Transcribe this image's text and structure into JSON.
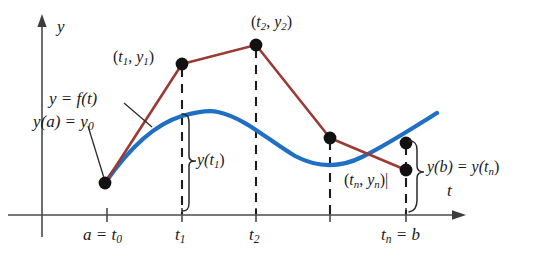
{
  "figure": {
    "colors": {
      "exact_curve": "#1f6fc4",
      "polygonal_path": "#9c3a35",
      "axis": "#4a4a4a",
      "point": "#121212",
      "text": "#1a1a1a",
      "background": "#ffffff"
    },
    "axes": {
      "y_axis_label": "y",
      "t_axis_label": "t"
    },
    "curve_label": "y = f(t)",
    "initial_value_label_parts": {
      "main": "y(a) = y",
      "sub": "0"
    },
    "points": [
      {
        "name": "t0-point",
        "px": 105,
        "py": 183,
        "label": null
      },
      {
        "name": "t1-point",
        "px": 182,
        "py": 64,
        "label": "(t1, y1)"
      },
      {
        "name": "t2-point",
        "px": 256,
        "py": 45,
        "label": "(t2, y2)"
      },
      {
        "name": "t3-point",
        "px": 330,
        "py": 138,
        "label": null
      },
      {
        "name": "tn-blue-point",
        "px": 406,
        "py": 143,
        "label": null
      },
      {
        "name": "tn-point",
        "px": 406,
        "py": 170,
        "label": "(tn, yn)"
      }
    ],
    "point_labels": [
      {
        "name": "label-t1y1",
        "open": "(",
        "t": "t",
        "tsub": "1",
        "comma": ", ",
        "y": "y",
        "ysub": "1",
        "close": ")"
      },
      {
        "name": "label-t2y2",
        "open": "(",
        "t": "t",
        "tsub": "2",
        "comma": ", ",
        "y": "y",
        "ysub": "2",
        "close": ")"
      },
      {
        "name": "label-tnyn",
        "open": "(",
        "t": "t",
        "tsub": "n",
        "comma": ", ",
        "y": "y",
        "ysub": "n",
        "close": ")|"
      }
    ],
    "tick_labels": [
      {
        "name": "tick-label-t0",
        "pre": "a = t",
        "sub": "0",
        "px": 107
      },
      {
        "name": "tick-label-t1",
        "pre": "t",
        "sub": "1",
        "px": 182
      },
      {
        "name": "tick-label-t2",
        "pre": "t",
        "sub": "2",
        "px": 256
      },
      {
        "name": "tick-label-tn",
        "pre": "t",
        "sub": "n",
        "post": " = b",
        "px": 406
      }
    ],
    "brace_labels": [
      {
        "name": "brace-label-yt1",
        "pre": "y(t",
        "sub": "1",
        "post": ")"
      },
      {
        "name": "brace-label-ybtn",
        "pre": "y(b) = y(t",
        "sub": "n",
        "post": ")"
      }
    ],
    "ticks_px": [
      107,
      182,
      256,
      330,
      406
    ],
    "axis_baseline_y": 215,
    "y_axis_x": 42
  }
}
